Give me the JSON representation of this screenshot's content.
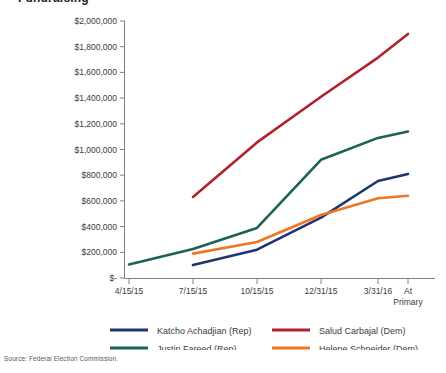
{
  "title_partial": "Fundraising",
  "source": "Source: Federal Election Commission.",
  "colors": {
    "katcho": "#1F3570",
    "salud": "#AF2331",
    "justin": "#1D6157",
    "helene": "#EF7622",
    "axis": "#808080",
    "text": "#3b3b3b"
  },
  "legend": {
    "items": [
      {
        "label": "Katcho Achadjian (Rep)",
        "color": "#1F3570"
      },
      {
        "label": "Salud Carbajal (Dem)",
        "color": "#AF2331"
      },
      {
        "label": "Justin Fareed (Rep)",
        "color": "#1D6157"
      },
      {
        "label": "Helene Schneider (Dem)",
        "color": "#EF7622"
      }
    ]
  },
  "chart_data": {
    "type": "line",
    "title": "Fundraising",
    "xlabel": "",
    "ylabel": "",
    "ylim": [
      0,
      2000000
    ],
    "grid": false,
    "legend_position": "bottom",
    "categories": [
      "4/15/15",
      "7/15/15",
      "10/15/15",
      "12/31/15",
      "3/31/16",
      "At Primary"
    ],
    "ytick_labels": [
      "$2,000,000",
      "$1,800,000",
      "$1,600,000",
      "$1,400,000",
      "$1,200,000",
      "$1,000,000",
      "$800,000",
      "$600,000",
      "$400,000",
      "$200,000",
      "$-"
    ],
    "ytick_values": [
      2000000,
      1800000,
      1600000,
      1400000,
      1200000,
      1000000,
      800000,
      600000,
      400000,
      200000,
      0
    ],
    "series": [
      {
        "name": "Katcho Achadjian (Rep)",
        "color": "#1F3570",
        "values": [
          null,
          100000,
          220000,
          470000,
          755000,
          810000
        ]
      },
      {
        "name": "Salud Carbajal (Dem)",
        "color": "#AF2331",
        "values": [
          null,
          630000,
          1055000,
          1410000,
          1715000,
          1900000
        ]
      },
      {
        "name": "Justin Fareed (Rep)",
        "color": "#1D6157",
        "values": [
          105000,
          225000,
          390000,
          920000,
          1090000,
          1140000
        ]
      },
      {
        "name": "Helene Schneider (Dem)",
        "color": "#EF7622",
        "values": [
          null,
          190000,
          280000,
          490000,
          620000,
          640000
        ]
      }
    ]
  }
}
